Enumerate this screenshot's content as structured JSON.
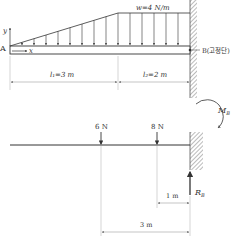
{
  "top_diagram": {
    "load_label": "w=4 N/m",
    "y_axis": "y",
    "x_axis": "x",
    "point_a": "A",
    "fixed_end_label": "B(고정단)",
    "span1_label": "l₁=3 m",
    "span2_label": "l₂=2 m"
  },
  "bottom_diagram": {
    "force1_label": "6 N",
    "force2_label": "8 N",
    "moment_label": "M",
    "moment_sub": "B",
    "reaction_label": "R",
    "reaction_sub": "B",
    "dim_short": "1 m",
    "dim_long": "3 m"
  },
  "colors": {
    "line": "#333333",
    "hatch": "#777777",
    "dim": "#888888"
  }
}
